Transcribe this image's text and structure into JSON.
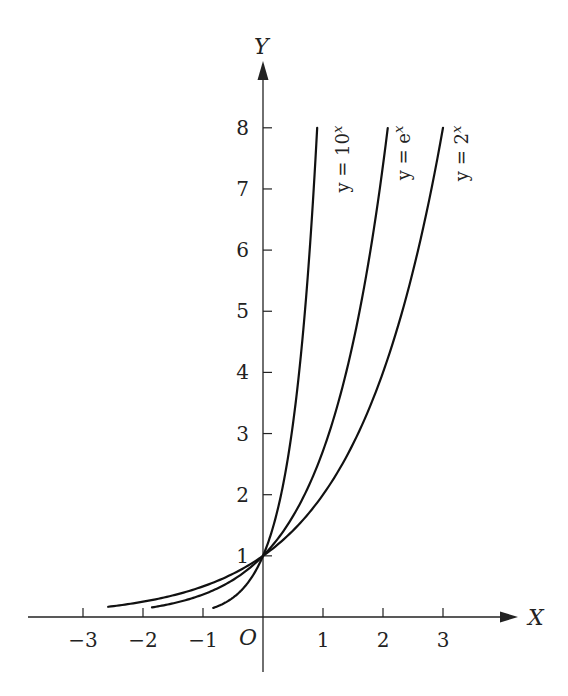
{
  "chart_data": {
    "type": "line",
    "title": "",
    "xlabel": "X",
    "ylabel": "Y",
    "origin_label": "O",
    "xlim": [
      -3.9,
      4.2
    ],
    "ylim": [
      -0.9,
      9.2
    ],
    "grid": false,
    "legend": "inline rotated labels at top of each curve",
    "x_ticks": [
      -3,
      -2,
      -1,
      1,
      2,
      3
    ],
    "x_tick_labels": [
      "−3",
      "−2",
      "−1",
      "1",
      "2",
      "3"
    ],
    "y_ticks": [
      1,
      2,
      3,
      4,
      5,
      6,
      7,
      8
    ],
    "y_tick_labels": [
      "1",
      "2",
      "3",
      "4",
      "5",
      "6",
      "7",
      "8"
    ],
    "series": [
      {
        "name": "y = 10^x",
        "label_base": "y = 10",
        "label_exp": "x",
        "base": 10,
        "x_range": [
          -0.83,
          0.903
        ],
        "x": [
          -0.83,
          -0.5,
          0,
          0.3,
          0.5,
          0.7,
          0.903
        ],
        "y": [
          0.148,
          0.316,
          1,
          2.0,
          3.16,
          5.01,
          8
        ]
      },
      {
        "name": "y = e^x",
        "label_base": "y = e",
        "label_exp": "x",
        "base": 2.718281828,
        "x_range": [
          -1.85,
          2.079
        ],
        "x": [
          -1.85,
          -1,
          0,
          1,
          1.5,
          2,
          2.079
        ],
        "y": [
          0.157,
          0.368,
          1,
          2.718,
          4.48,
          7.39,
          8
        ]
      },
      {
        "name": "y = 2^x",
        "label_base": "y = 2",
        "label_exp": "x",
        "base": 2,
        "x_range": [
          -2.58,
          3
        ],
        "x": [
          -2.58,
          -2,
          -1,
          0,
          1,
          2,
          3
        ],
        "y": [
          0.167,
          0.25,
          0.5,
          1,
          2,
          4,
          8
        ]
      }
    ],
    "annotations": [
      "All three curves pass through (0, 1)"
    ]
  }
}
